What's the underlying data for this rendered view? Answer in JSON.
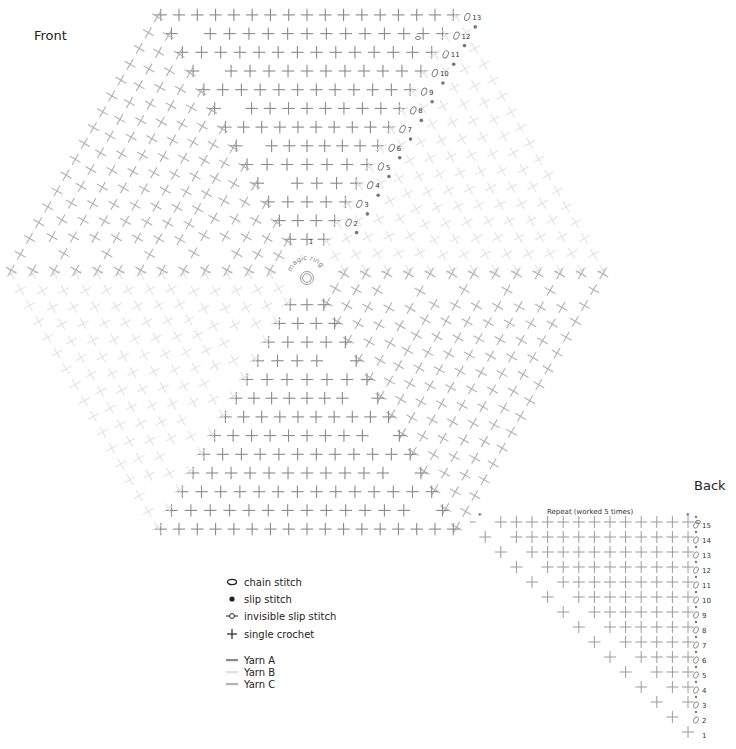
{
  "front": {
    "title": "Front",
    "center_label": "magic ring",
    "rows": 13,
    "row_numbers": [
      "1",
      "2",
      "3",
      "4",
      "5",
      "6",
      "7",
      "8",
      "9",
      "10",
      "11",
      "12",
      "13"
    ],
    "wedges": [
      {
        "id": "top",
        "yarn": "A"
      },
      {
        "id": "upper-right",
        "yarn": "B"
      },
      {
        "id": "lower-right",
        "yarn": "C"
      },
      {
        "id": "bottom",
        "yarn": "A"
      },
      {
        "id": "lower-left",
        "yarn": "B"
      },
      {
        "id": "upper-left",
        "yarn": "C"
      }
    ]
  },
  "back": {
    "title": "Back",
    "repeat_label": "Repeat (worked 5 times)",
    "rows": 15,
    "row_numbers": [
      "1",
      "2",
      "3",
      "4",
      "5",
      "6",
      "7",
      "8",
      "9",
      "10",
      "11",
      "12",
      "13",
      "14",
      "15"
    ]
  },
  "legend": {
    "symbols": [
      {
        "icon": "chain-stitch-icon",
        "label": "chain stitch"
      },
      {
        "icon": "slip-stitch-icon",
        "label": "slip stitch"
      },
      {
        "icon": "invisible-slip-stitch-icon",
        "label": "invisible slip stitch"
      },
      {
        "icon": "single-crochet-icon",
        "label": "single crochet"
      }
    ],
    "yarns": [
      {
        "label": "Yarn A",
        "color": "#8a8a8a"
      },
      {
        "label": "Yarn B",
        "color": "#e3e3e3"
      },
      {
        "label": "Yarn C",
        "color": "#b4b4b4"
      }
    ]
  },
  "colors": {
    "yarn_a": "#8a8a8a",
    "yarn_b": "#e2e2e2",
    "yarn_c": "#b0b0b0",
    "text": "#222222",
    "dot": "#777777"
  }
}
